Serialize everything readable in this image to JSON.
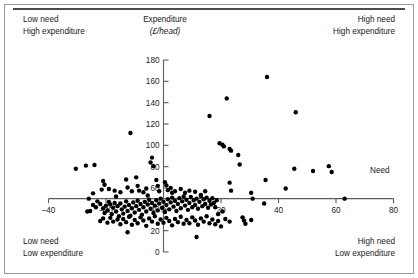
{
  "figure": {
    "quadrant_labels": {
      "top_left": {
        "line1": "Low need",
        "line2": "High expenditure"
      },
      "top_right": {
        "line1": "High need",
        "line2": "High expenditure"
      },
      "bottom_left": {
        "line1": "Low need",
        "line2": "Low expenditure"
      },
      "bottom_right": {
        "line1": "High need",
        "line2": "Low expenditure"
      }
    }
  },
  "chart_data": {
    "type": "scatter",
    "title": "",
    "subtitle": "",
    "xlabel": "Need",
    "ylabel": "Expenditure",
    "ylabel_line2": "(£/head)",
    "ylabel_currency_symbol": "£",
    "xlim": [
      -40,
      80
    ],
    "ylim": [
      0,
      180
    ],
    "xticks": [
      -40,
      -20,
      0,
      20,
      40,
      60,
      80
    ],
    "xticklabels": [
      "–40",
      "–20",
      "0",
      "20",
      "40",
      "60",
      "80"
    ],
    "yticks": [
      0,
      20,
      40,
      60,
      80,
      100,
      120,
      140,
      160,
      180
    ],
    "yticklabels": [
      "0",
      "20",
      "40",
      "60",
      "80",
      "100",
      "120",
      "140",
      "160",
      "180"
    ],
    "grid": false,
    "legend": null,
    "x_axis_crosses_y_at": 50,
    "y_axis_crosses_x_at": 0,
    "marker": {
      "shape": "circle",
      "color": "#000000",
      "size": 2.2
    },
    "points": [
      [
        -30.5,
        78.0
      ],
      [
        -27.0,
        81.0
      ],
      [
        -24.0,
        81.5
      ],
      [
        -11.5,
        111.5
      ],
      [
        -21.0,
        66.5
      ],
      [
        -20.5,
        63.0
      ],
      [
        -21.5,
        58.5
      ],
      [
        -19.0,
        59.0
      ],
      [
        -17.0,
        57.5
      ],
      [
        -16.5,
        52.0
      ],
      [
        -15.0,
        56.0
      ],
      [
        -13.0,
        68.0
      ],
      [
        -12.5,
        60.5
      ],
      [
        -11.0,
        57.0
      ],
      [
        -9.5,
        70.0
      ],
      [
        -9.0,
        62.0
      ],
      [
        -8.5,
        57.5
      ],
      [
        -7.0,
        56.0
      ],
      [
        -6.0,
        59.5
      ],
      [
        -5.5,
        53.0
      ],
      [
        -4.0,
        88.5
      ],
      [
        -4.5,
        84.0
      ],
      [
        -3.5,
        80.5
      ],
      [
        -2.5,
        67.5
      ],
      [
        -2.0,
        62.0
      ],
      [
        -1.5,
        57.0
      ],
      [
        0.5,
        65.5
      ],
      [
        1.0,
        62.5
      ],
      [
        1.5,
        58.0
      ],
      [
        2.5,
        60.0
      ],
      [
        3.0,
        55.5
      ],
      [
        4.0,
        57.0
      ],
      [
        6.0,
        59.0
      ],
      [
        7.5,
        55.5
      ],
      [
        9.0,
        57.5
      ],
      [
        11.0,
        56.5
      ],
      [
        13.0,
        53.5
      ],
      [
        14.5,
        57.0
      ],
      [
        16.0,
        127.5
      ],
      [
        19.5,
        102.0
      ],
      [
        20.5,
        100.5
      ],
      [
        21.0,
        99.0
      ],
      [
        22.0,
        144.0
      ],
      [
        23.0,
        96.5
      ],
      [
        23.5,
        95.0
      ],
      [
        23.0,
        65.0
      ],
      [
        23.5,
        57.5
      ],
      [
        26.0,
        91.0
      ],
      [
        26.5,
        82.0
      ],
      [
        30.5,
        55.5
      ],
      [
        31.0,
        50.0
      ],
      [
        36.0,
        164.0
      ],
      [
        35.5,
        67.5
      ],
      [
        35.0,
        45.5
      ],
      [
        42.5,
        59.5
      ],
      [
        45.5,
        78.0
      ],
      [
        46.0,
        131.0
      ],
      [
        52.0,
        76.0
      ],
      [
        57.5,
        80.5
      ],
      [
        58.5,
        75.0
      ],
      [
        63.0,
        50.0
      ],
      [
        -26.5,
        38.0
      ],
      [
        -25.5,
        38.5
      ],
      [
        -24.5,
        44.0
      ],
      [
        -23.5,
        42.0
      ],
      [
        -23.0,
        47.5
      ],
      [
        -22.0,
        45.0
      ],
      [
        -21.0,
        41.0
      ],
      [
        -20.5,
        36.5
      ],
      [
        -20.0,
        43.5
      ],
      [
        -19.5,
        39.0
      ],
      [
        -19.0,
        47.0
      ],
      [
        -18.5,
        44.5
      ],
      [
        -18.0,
        35.5
      ],
      [
        -17.5,
        41.5
      ],
      [
        -17.0,
        46.0
      ],
      [
        -16.5,
        38.0
      ],
      [
        -16.0,
        43.0
      ],
      [
        -15.5,
        33.5
      ],
      [
        -15.0,
        45.5
      ],
      [
        -14.5,
        40.0
      ],
      [
        -14.0,
        36.0
      ],
      [
        -13.5,
        42.5
      ],
      [
        -13.0,
        47.5
      ],
      [
        -12.5,
        38.5
      ],
      [
        -12.0,
        44.0
      ],
      [
        -11.5,
        34.0
      ],
      [
        -11.0,
        41.0
      ],
      [
        -10.5,
        46.5
      ],
      [
        -10.0,
        37.0
      ],
      [
        -9.5,
        43.0
      ],
      [
        -9.0,
        48.0
      ],
      [
        -8.5,
        39.5
      ],
      [
        -8.0,
        45.0
      ],
      [
        -7.5,
        35.0
      ],
      [
        -7.0,
        42.0
      ],
      [
        -6.5,
        47.0
      ],
      [
        -6.0,
        38.0
      ],
      [
        -5.5,
        44.5
      ],
      [
        -5.0,
        49.0
      ],
      [
        -4.5,
        40.5
      ],
      [
        -4.0,
        46.0
      ],
      [
        -3.5,
        36.5
      ],
      [
        -3.0,
        43.5
      ],
      [
        -2.5,
        48.5
      ],
      [
        -2.0,
        39.0
      ],
      [
        -1.5,
        45.5
      ],
      [
        -1.0,
        50.0
      ],
      [
        -0.5,
        41.5
      ],
      [
        0.0,
        47.0
      ],
      [
        0.5,
        37.5
      ],
      [
        1.0,
        44.0
      ],
      [
        1.5,
        49.5
      ],
      [
        2.0,
        40.0
      ],
      [
        2.5,
        46.5
      ],
      [
        3.0,
        51.0
      ],
      [
        3.5,
        42.5
      ],
      [
        4.0,
        48.0
      ],
      [
        4.5,
        38.5
      ],
      [
        5.0,
        45.0
      ],
      [
        5.5,
        50.5
      ],
      [
        6.0,
        41.0
      ],
      [
        6.5,
        47.5
      ],
      [
        7.0,
        52.0
      ],
      [
        7.5,
        43.5
      ],
      [
        8.0,
        49.0
      ],
      [
        8.5,
        39.5
      ],
      [
        9.0,
        46.0
      ],
      [
        9.5,
        51.5
      ],
      [
        10.0,
        42.0
      ],
      [
        10.5,
        48.5
      ],
      [
        11.0,
        44.0
      ],
      [
        11.5,
        50.0
      ],
      [
        12.0,
        40.5
      ],
      [
        12.5,
        47.0
      ],
      [
        13.0,
        52.5
      ],
      [
        13.5,
        43.0
      ],
      [
        14.0,
        49.5
      ],
      [
        14.5,
        45.0
      ],
      [
        15.0,
        51.0
      ],
      [
        15.5,
        41.5
      ],
      [
        16.0,
        48.0
      ],
      [
        16.5,
        44.5
      ],
      [
        17.0,
        50.5
      ],
      [
        17.5,
        46.0
      ],
      [
        18.0,
        42.0
      ],
      [
        18.5,
        48.5
      ],
      [
        -22.0,
        29.0
      ],
      [
        -21.0,
        31.5
      ],
      [
        -19.5,
        27.5
      ],
      [
        -18.5,
        32.0
      ],
      [
        -17.5,
        28.5
      ],
      [
        -16.0,
        30.5
      ],
      [
        -15.0,
        26.0
      ],
      [
        -14.0,
        31.0
      ],
      [
        -13.0,
        28.0
      ],
      [
        -12.0,
        33.0
      ],
      [
        -11.0,
        25.5
      ],
      [
        -10.0,
        30.0
      ],
      [
        -9.0,
        27.0
      ],
      [
        -8.0,
        32.5
      ],
      [
        -7.0,
        29.5
      ],
      [
        -6.0,
        24.5
      ],
      [
        -5.0,
        31.5
      ],
      [
        -4.0,
        28.5
      ],
      [
        -3.0,
        33.5
      ],
      [
        -2.0,
        26.5
      ],
      [
        -1.0,
        30.5
      ],
      [
        0.0,
        27.5
      ],
      [
        1.0,
        32.0
      ],
      [
        2.0,
        29.0
      ],
      [
        3.0,
        25.0
      ],
      [
        4.0,
        31.0
      ],
      [
        5.0,
        28.0
      ],
      [
        6.0,
        33.0
      ],
      [
        7.0,
        26.5
      ],
      [
        8.0,
        30.0
      ],
      [
        9.0,
        27.0
      ],
      [
        10.0,
        32.5
      ],
      [
        11.0,
        29.5
      ],
      [
        12.0,
        25.5
      ],
      [
        13.0,
        31.5
      ],
      [
        14.0,
        28.5
      ],
      [
        15.0,
        33.5
      ],
      [
        16.0,
        27.0
      ],
      [
        17.0,
        30.5
      ],
      [
        18.0,
        26.0
      ],
      [
        19.0,
        29.0
      ],
      [
        20.0,
        24.0
      ],
      [
        -12.5,
        18.5
      ],
      [
        11.5,
        14.0
      ],
      [
        -24.5,
        55.0
      ],
      [
        -26.0,
        50.0
      ],
      [
        21.5,
        31.0
      ],
      [
        23.0,
        28.5
      ],
      [
        27.5,
        32.5
      ],
      [
        28.0,
        29.5
      ],
      [
        28.5,
        26.5
      ],
      [
        30.5,
        30.0
      ],
      [
        19.0,
        35.5
      ],
      [
        20.5,
        38.0
      ]
    ]
  }
}
